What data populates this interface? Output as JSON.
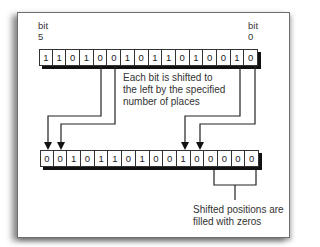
{
  "diagram": {
    "top_labels": {
      "left": {
        "line1": "bit",
        "line2": "5"
      },
      "right": {
        "line1": "bit",
        "line2": "0"
      }
    },
    "original_bits": [
      "1",
      "1",
      "0",
      "1",
      "0",
      "0",
      "1",
      "0",
      "1",
      "1",
      "0",
      "1",
      "0",
      "0",
      "1",
      "0"
    ],
    "shifted_bits": [
      "0",
      "0",
      "1",
      "0",
      "1",
      "1",
      "0",
      "1",
      "0",
      "0",
      "1",
      "0",
      "0",
      "0",
      "0",
      "0"
    ],
    "shift_note": {
      "line1": "Each bit is shifted to",
      "line2": "the left by the specified",
      "line3": "number of places"
    },
    "fill_note": {
      "line1": "Shifted positions are",
      "line2": "filled with zeros"
    }
  }
}
